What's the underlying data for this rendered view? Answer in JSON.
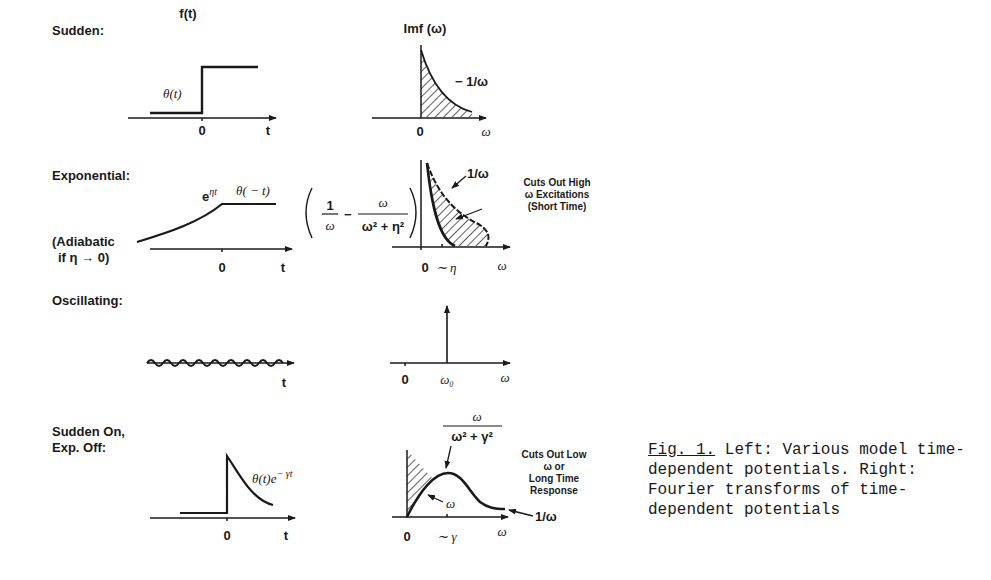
{
  "figure": {
    "column_headers": {
      "time_domain": "f(t)",
      "frequency_domain": "Imf (ω)"
    },
    "rows": [
      {
        "label": "Sudden:",
        "time_curve_label": "θ(t)",
        "time_ticks": [
          "0",
          "t"
        ],
        "freq_curve_label": "− 1/ω",
        "freq_ticks": [
          "0",
          "ω"
        ]
      },
      {
        "label": "Exponential:",
        "sublabel_line1": "(Adiabatic",
        "sublabel_line2": "if η → 0)",
        "time_curve_label_a": "e",
        "time_curve_label_a_sup": "ηt",
        "time_curve_label_b": "θ( − t)",
        "time_ticks": [
          "0",
          "t"
        ],
        "formula_num1": "1",
        "formula_den1": "ω",
        "formula_minus": "−",
        "formula_num2": "ω",
        "formula_den2": "ω² + η²",
        "freq_curve_label": "1/ω",
        "freq_ticks": [
          "0",
          "∼ η",
          "ω"
        ],
        "annotation_line1": "Cuts Out High",
        "annotation_line2": "ω Excitations",
        "annotation_line3": "(Short Time)"
      },
      {
        "label": "Oscillating:",
        "time_ticks": [
          "t"
        ],
        "freq_ticks": [
          "0",
          "ω₀",
          "ω"
        ]
      },
      {
        "label_line1": "Sudden On,",
        "label_line2": "Exp. Off:",
        "time_curve_label": "θ(t)e",
        "time_curve_label_sup": "− γt",
        "time_ticks": [
          "0",
          "t"
        ],
        "formula_num": "ω",
        "formula_den": "ω² + γ²",
        "hatched_label": "ω",
        "tail_label": "1/ω",
        "freq_ticks": [
          "0",
          "∼ γ",
          "ω"
        ],
        "annotation_line1": "Cuts Out Low",
        "annotation_line2": "ω or",
        "annotation_line3": "Long Time",
        "annotation_line4": "Response"
      }
    ]
  },
  "caption": {
    "figref": "Fig. 1.",
    "text": " Left: Various model time-dependent potentials. Right: Fourier transforms of time-dependent potentials"
  },
  "colors": {
    "ink": "#1a1a1a",
    "background": "#ffffff"
  }
}
